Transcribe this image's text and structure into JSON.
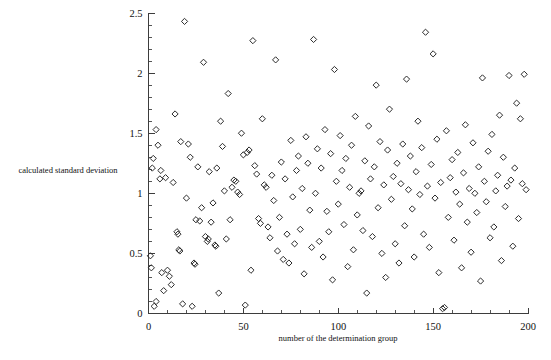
{
  "chart_data": {
    "type": "scatter",
    "title": "",
    "xlabel": "number of the determination group",
    "ylabel": "calculated standard deviation",
    "xlim": [
      0,
      200
    ],
    "ylim": [
      0,
      2.5
    ],
    "grid": false,
    "legend": null,
    "x_ticks": [
      0,
      50,
      100,
      150,
      200
    ],
    "x_tick_labels": [
      "0",
      "50",
      "100",
      "150",
      "200"
    ],
    "x_minor_step": 10,
    "y_ticks": [
      0,
      0.5,
      1,
      1.5,
      2,
      2.5
    ],
    "y_tick_labels": [
      "0",
      "0.5",
      "1",
      "1.5",
      "2",
      "2.5"
    ],
    "y_minor_step": 0.1,
    "marker": "open-diamond",
    "marker_color": "#2b2b2b",
    "marker_size": 5,
    "series": [
      {
        "name": "calculated standard deviation",
        "points": [
          [
            1,
            0.48
          ],
          [
            1.5,
            0.38
          ],
          [
            2,
            1.21
          ],
          [
            2.5,
            1.29
          ],
          [
            3,
            0.06
          ],
          [
            4,
            1.53
          ],
          [
            4,
            0.1
          ],
          [
            5,
            1.4
          ],
          [
            6,
            1.12
          ],
          [
            6.5,
            1.19
          ],
          [
            7,
            0.34
          ],
          [
            8,
            0.19
          ],
          [
            9,
            1.13
          ],
          [
            10,
            0.36
          ],
          [
            11,
            0.31
          ],
          [
            12,
            0.24
          ],
          [
            13,
            1.09
          ],
          [
            14,
            1.66
          ],
          [
            15,
            0.68
          ],
          [
            15.5,
            0.66
          ],
          [
            16,
            0.53
          ],
          [
            16.5,
            0.52
          ],
          [
            17,
            1.43
          ],
          [
            18,
            0.08
          ],
          [
            19,
            2.43
          ],
          [
            20,
            0.96
          ],
          [
            21,
            1.41
          ],
          [
            22,
            1.3
          ],
          [
            23,
            0.06
          ],
          [
            24,
            0.42
          ],
          [
            24.5,
            0.41
          ],
          [
            25,
            0.78
          ],
          [
            26,
            1.22
          ],
          [
            27,
            0.77
          ],
          [
            28,
            0.88
          ],
          [
            29,
            2.09
          ],
          [
            30,
            0.64
          ],
          [
            31,
            0.6
          ],
          [
            31.5,
            0.62
          ],
          [
            32,
            1.18
          ],
          [
            33,
            0.76
          ],
          [
            34,
            0.92
          ],
          [
            35,
            0.57
          ],
          [
            35.5,
            0.56
          ],
          [
            36,
            1.21
          ],
          [
            37,
            0.17
          ],
          [
            38,
            1.6
          ],
          [
            39,
            1.39
          ],
          [
            40,
            1.02
          ],
          [
            41,
            0.62
          ],
          [
            42,
            1.83
          ],
          [
            43,
            0.78
          ],
          [
            44,
            1.05
          ],
          [
            45,
            1.11
          ],
          [
            46,
            1.1
          ],
          [
            47,
            1.01
          ],
          [
            48,
            0.99
          ],
          [
            49,
            1.5
          ],
          [
            50,
            1.32
          ],
          [
            51,
            0.07
          ],
          [
            52,
            1.34
          ],
          [
            53,
            1.36
          ],
          [
            54,
            0.36
          ],
          [
            55,
            2.27
          ],
          [
            56,
            1.23
          ],
          [
            57,
            1.16
          ],
          [
            58,
            0.79
          ],
          [
            59,
            0.75
          ],
          [
            60,
            1.62
          ],
          [
            61,
            1.07
          ],
          [
            62,
            1.05
          ],
          [
            63,
            0.72
          ],
          [
            64,
            0.63
          ],
          [
            65,
            1.15
          ],
          [
            66,
            0.94
          ],
          [
            67,
            2.11
          ],
          [
            68,
            0.52
          ],
          [
            69,
            0.8
          ],
          [
            70,
            1.26
          ],
          [
            71,
            0.45
          ],
          [
            72,
            1.12
          ],
          [
            73,
            0.66
          ],
          [
            74,
            0.42
          ],
          [
            75,
            1.44
          ],
          [
            76,
            0.97
          ],
          [
            77,
            0.58
          ],
          [
            78,
            1.19
          ],
          [
            79,
            1.31
          ],
          [
            80,
            0.7
          ],
          [
            81,
            1.04
          ],
          [
            82,
            0.33
          ],
          [
            83,
            1.47
          ],
          [
            84,
            1.25
          ],
          [
            85,
            0.86
          ],
          [
            86,
            0.55
          ],
          [
            87,
            2.28
          ],
          [
            88,
            1.0
          ],
          [
            89,
            1.37
          ],
          [
            90,
            0.6
          ],
          [
            91,
            1.21
          ],
          [
            92,
            0.47
          ],
          [
            93,
            1.53
          ],
          [
            94,
            0.85
          ],
          [
            95,
            0.68
          ],
          [
            96,
            1.33
          ],
          [
            97,
            0.28
          ],
          [
            98,
            2.03
          ],
          [
            99,
            1.1
          ],
          [
            100,
            0.91
          ],
          [
            101,
            1.48
          ],
          [
            102,
            1.19
          ],
          [
            103,
            0.74
          ],
          [
            104,
            1.29
          ],
          [
            105,
            0.39
          ],
          [
            106,
            1.05
          ],
          [
            107,
            1.4
          ],
          [
            108,
            0.53
          ],
          [
            109,
            1.64
          ],
          [
            110,
            0.82
          ],
          [
            111,
            1.0
          ],
          [
            112,
            1.02
          ],
          [
            113,
            0.69
          ],
          [
            114,
            1.27
          ],
          [
            115,
            0.17
          ],
          [
            116,
            1.56
          ],
          [
            117,
            1.12
          ],
          [
            118,
            0.64
          ],
          [
            119,
            1.22
          ],
          [
            120,
            1.9
          ],
          [
            121,
            0.88
          ],
          [
            122,
            1.43
          ],
          [
            123,
            0.5
          ],
          [
            124,
            1.07
          ],
          [
            125,
            0.3
          ],
          [
            126,
            1.36
          ],
          [
            127,
            1.7
          ],
          [
            128,
            0.95
          ],
          [
            129,
            1.14
          ],
          [
            130,
            0.58
          ],
          [
            131,
            1.25
          ],
          [
            132,
            0.42
          ],
          [
            133,
            1.08
          ],
          [
            134,
            1.41
          ],
          [
            135,
            0.73
          ],
          [
            136,
            1.95
          ],
          [
            137,
            1.03
          ],
          [
            138,
            1.31
          ],
          [
            139,
            0.87
          ],
          [
            140,
            0.47
          ],
          [
            141,
            1.18
          ],
          [
            142,
            1.6
          ],
          [
            143,
            0.99
          ],
          [
            144,
            1.38
          ],
          [
            145,
            0.66
          ],
          [
            146,
            2.34
          ],
          [
            147,
            1.06
          ],
          [
            148,
            0.55
          ],
          [
            149,
            1.24
          ],
          [
            150,
            2.16
          ],
          [
            151,
            0.96
          ],
          [
            152,
            1.45
          ],
          [
            153,
            0.34
          ],
          [
            154,
            1.09
          ],
          [
            155,
            0.04
          ],
          [
            156,
            0.05
          ],
          [
            157,
            1.52
          ],
          [
            158,
            0.8
          ],
          [
            159,
            1.13
          ],
          [
            160,
            1.28
          ],
          [
            161,
            0.61
          ],
          [
            162,
            1.01
          ],
          [
            163,
            1.34
          ],
          [
            164,
            0.91
          ],
          [
            165,
            0.38
          ],
          [
            166,
            1.17
          ],
          [
            167,
            1.57
          ],
          [
            168,
            0.76
          ],
          [
            169,
            1.04
          ],
          [
            170,
            0.51
          ],
          [
            171,
            1.42
          ],
          [
            172,
            1.0
          ],
          [
            173,
            0.84
          ],
          [
            174,
            1.22
          ],
          [
            175,
            0.27
          ],
          [
            176,
            1.96
          ],
          [
            177,
            1.1
          ],
          [
            178,
            0.93
          ],
          [
            179,
            1.35
          ],
          [
            180,
            0.63
          ],
          [
            181,
            1.49
          ],
          [
            182,
            0.72
          ],
          [
            183,
            1.02
          ],
          [
            184,
            1.15
          ],
          [
            185,
            1.65
          ],
          [
            186,
            0.44
          ],
          [
            187,
            1.3
          ],
          [
            188,
            0.89
          ],
          [
            189,
            1.06
          ],
          [
            190,
            1.98
          ],
          [
            191,
            1.11
          ],
          [
            192,
            0.56
          ],
          [
            193,
            1.21
          ],
          [
            194,
            1.75
          ],
          [
            195,
            0.79
          ],
          [
            196,
            1.62
          ],
          [
            197,
            1.08
          ],
          [
            198,
            1.99
          ],
          [
            199,
            1.03
          ]
        ]
      }
    ]
  },
  "figure": {
    "background_color": "#ffffff",
    "axis_color": "#3d3d3d"
  }
}
